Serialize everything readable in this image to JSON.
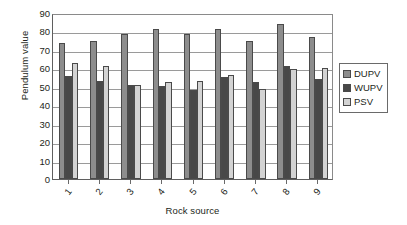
{
  "chart_data": {
    "type": "bar",
    "title": "",
    "xlabel": "Rock source",
    "ylabel": "Pendulum value",
    "categories": [
      "1",
      "2",
      "3",
      "4",
      "5",
      "6",
      "7",
      "8",
      "9"
    ],
    "series": [
      {
        "name": "DUPV",
        "color": "#8d8d8d",
        "values": [
          74,
          75,
          78.5,
          81.5,
          78.5,
          81.5,
          75,
          84,
          77
        ]
      },
      {
        "name": "WUPV",
        "color": "#484848",
        "values": [
          56,
          53,
          51,
          50.5,
          48.5,
          55.5,
          52.5,
          61.5,
          54
        ]
      },
      {
        "name": "PSV",
        "color": "#d3d3d3",
        "values": [
          63,
          61.5,
          51,
          52.5,
          53,
          56.5,
          49,
          59.5,
          60
        ]
      }
    ],
    "ylim": [
      0,
      90
    ],
    "ytick_step": 10,
    "yticks": [
      0,
      10,
      20,
      30,
      40,
      50,
      60,
      70,
      80,
      90
    ],
    "grid": true,
    "legend_position": "right"
  }
}
